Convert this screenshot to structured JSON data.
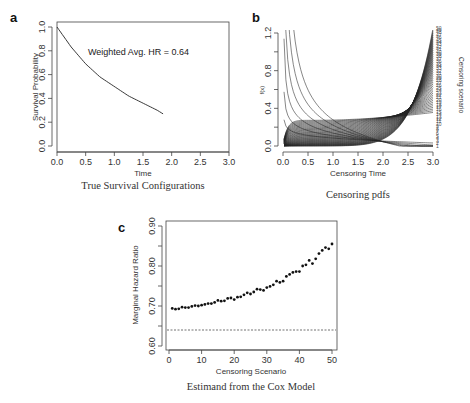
{
  "panels": {
    "a": {
      "letter": "a",
      "caption": "True Survival Configurations",
      "annotation": "Weighted Avg. HR = 0.64"
    },
    "b": {
      "letter": "b",
      "caption": "Censoring pdfs",
      "side_label": "Censoring scenario"
    },
    "c": {
      "letter": "c",
      "caption": "Estimand from the Cox Model"
    }
  },
  "chart_data": [
    {
      "id": "a",
      "type": "line",
      "title": "True Survival Configurations",
      "xlabel": "Time",
      "ylabel": "Survival Probability",
      "xlim": [
        0,
        3
      ],
      "ylim": [
        0,
        1
      ],
      "xticks": [
        "0.0",
        "0.5",
        "1.0",
        "1.5",
        "2.0",
        "2.5",
        "3.0"
      ],
      "yticks": [
        "0.0",
        "0.2",
        "0.4",
        "0.6",
        "0.8",
        "1.0"
      ],
      "annotations": [
        "Weighted Avg. HR = 0.64"
      ],
      "grid": false,
      "box": true,
      "series": [
        {
          "name": "Survival",
          "x": [
            0.0,
            0.25,
            0.5,
            0.75,
            1.0,
            1.25,
            1.5,
            1.75,
            1.85
          ],
          "y": [
            1.0,
            0.83,
            0.69,
            0.58,
            0.5,
            0.42,
            0.36,
            0.3,
            0.27
          ]
        }
      ]
    },
    {
      "id": "b",
      "type": "line",
      "title": "Censoring pdfs",
      "xlabel": "Censoring Time",
      "ylabel": "f(x)",
      "xlim": [
        0,
        3
      ],
      "ylim": [
        0,
        1.2
      ],
      "xticks": [
        "0.0",
        "0.5",
        "1.0",
        "1.5",
        "2.0",
        "2.5",
        "3.0"
      ],
      "yticks": [
        "0.0",
        "0.4",
        "0.8",
        "1.2"
      ],
      "grid": false,
      "box": false,
      "legend": {
        "title": "Censoring scenario",
        "position": "right",
        "entries": [
          "1-50"
        ]
      },
      "series_description": "50 censoring probability density functions on [0,3]; early scenarios decreasing (high density near 0), later scenarios increasing towards t=3 with end values spanning ~0.0 to ~1.22",
      "n_series": 50
    },
    {
      "id": "c",
      "type": "scatter",
      "title": "Estimand from the Cox Model",
      "xlabel": "Censoring Scenario",
      "ylabel": "Marginal Hazard Ratio",
      "xlim": [
        0,
        50
      ],
      "ylim": [
        0.6,
        0.9
      ],
      "xticks": [
        "0",
        "10",
        "20",
        "30",
        "40",
        "50"
      ],
      "yticks": [
        "0.60",
        "0.70",
        "0.80",
        "0.90"
      ],
      "grid": false,
      "box": true,
      "reference_line": {
        "y": 0.64,
        "style": "dashed"
      },
      "x": [
        1,
        2,
        3,
        4,
        5,
        6,
        7,
        8,
        9,
        10,
        11,
        12,
        13,
        14,
        15,
        16,
        17,
        18,
        19,
        20,
        21,
        22,
        23,
        24,
        25,
        26,
        27,
        28,
        29,
        30,
        31,
        32,
        33,
        34,
        35,
        36,
        37,
        38,
        39,
        40,
        41,
        42,
        43,
        44,
        45,
        46,
        47,
        48,
        49,
        50
      ],
      "y": [
        0.694,
        0.692,
        0.693,
        0.697,
        0.696,
        0.696,
        0.699,
        0.701,
        0.7,
        0.702,
        0.704,
        0.706,
        0.706,
        0.709,
        0.714,
        0.712,
        0.713,
        0.719,
        0.72,
        0.716,
        0.722,
        0.723,
        0.728,
        0.733,
        0.73,
        0.735,
        0.742,
        0.741,
        0.739,
        0.746,
        0.749,
        0.753,
        0.762,
        0.759,
        0.762,
        0.774,
        0.779,
        0.784,
        0.786,
        0.786,
        0.8,
        0.803,
        0.814,
        0.806,
        0.818,
        0.831,
        0.839,
        0.846,
        0.843,
        0.855
      ]
    }
  ]
}
